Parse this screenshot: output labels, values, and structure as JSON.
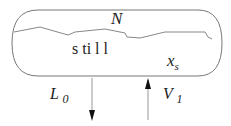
{
  "diagram": {
    "vessel_label_top": "N",
    "vessel_label_region": "s ti l l",
    "composition_label": "x",
    "composition_subscript": "s",
    "outflow_label": "L",
    "outflow_subscript": "0",
    "inflow_label": "V",
    "inflow_subscript": "1"
  }
}
